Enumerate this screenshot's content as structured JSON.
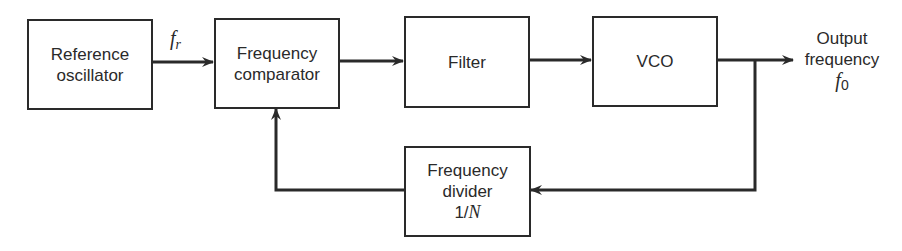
{
  "diagram": {
    "type": "block-diagram",
    "title": "",
    "blocks": [
      {
        "id": "ref_osc",
        "lines": [
          "Reference",
          "oscillator"
        ]
      },
      {
        "id": "freq_comp",
        "lines": [
          "Frequency",
          "comparator"
        ]
      },
      {
        "id": "filter",
        "lines": [
          "Filter"
        ]
      },
      {
        "id": "vco",
        "lines": [
          "VCO"
        ]
      },
      {
        "id": "divider",
        "lines": [
          "Frequency",
          "divider",
          "1/N"
        ],
        "ratio_prefix": "1/",
        "ratio_var": "N"
      }
    ],
    "signals": {
      "reference": {
        "symbol": "f",
        "subscript": "r"
      },
      "output": {
        "label_line1": "Output",
        "label_line2": "frequency",
        "symbol": "f",
        "subscript": "0"
      }
    },
    "connections": [
      {
        "from": "ref_osc",
        "to": "freq_comp",
        "label": "f_r"
      },
      {
        "from": "freq_comp",
        "to": "filter"
      },
      {
        "from": "filter",
        "to": "vco"
      },
      {
        "from": "vco",
        "to": "output",
        "label": "f_0"
      },
      {
        "from": "vco",
        "to": "divider",
        "note": "feedback tap"
      },
      {
        "from": "divider",
        "to": "freq_comp",
        "note": "feedback"
      }
    ],
    "colors": {
      "line": "#2a2a2a",
      "background": "#ffffff"
    }
  }
}
